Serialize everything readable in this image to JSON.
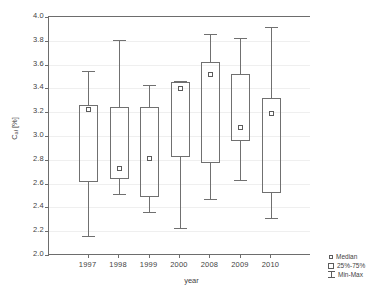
{
  "chart_data": {
    "type": "box",
    "title": "",
    "xlabel": "year",
    "ylabel_html": "C<sub>ał</sub> [%]",
    "ylabel": "Cał [%]",
    "categories": [
      "1997",
      "1998",
      "1999",
      "2000",
      "2008",
      "2009",
      "2010"
    ],
    "ylim": [
      2.0,
      4.0
    ],
    "ytick_step": 0.2,
    "yticks": [
      "2.0",
      "2.2",
      "2.4",
      "2.6",
      "2.8",
      "3.0",
      "3.2",
      "3.4",
      "3.6",
      "3.8",
      "4.0"
    ],
    "grid": true,
    "legend_position": "bottom-right",
    "legend": [
      {
        "key": "median",
        "label": "Median",
        "marker": "small-square"
      },
      {
        "key": "quartiles",
        "label": "25%-75%",
        "marker": "box"
      },
      {
        "key": "range",
        "label": "Min-Max",
        "marker": "whisker"
      }
    ],
    "boxes": [
      {
        "category": "1997",
        "min": 2.16,
        "q1": 2.61,
        "median": 3.22,
        "q3": 3.26,
        "max": 3.55
      },
      {
        "category": "1998",
        "min": 2.51,
        "q1": 2.64,
        "median": 2.73,
        "q3": 3.24,
        "max": 3.81
      },
      {
        "category": "1999",
        "min": 2.36,
        "q1": 2.49,
        "median": 2.81,
        "q3": 3.24,
        "max": 3.43
      },
      {
        "category": "2000",
        "min": 2.23,
        "q1": 2.82,
        "median": 3.4,
        "q3": 3.45,
        "max": 3.46
      },
      {
        "category": "2008",
        "min": 2.47,
        "q1": 2.77,
        "median": 3.52,
        "q3": 3.62,
        "max": 3.86
      },
      {
        "category": "2009",
        "min": 2.63,
        "q1": 2.96,
        "median": 3.07,
        "q3": 3.52,
        "max": 3.82
      },
      {
        "category": "2010",
        "min": 2.31,
        "q1": 2.52,
        "median": 3.19,
        "q3": 3.32,
        "max": 3.92
      }
    ]
  }
}
